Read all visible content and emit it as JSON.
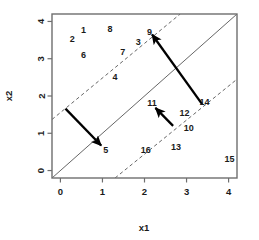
{
  "chart_data": {
    "type": "scatter",
    "title": "",
    "xlabel": "x1",
    "ylabel": "x2",
    "xlim": [
      -0.2,
      4.2
    ],
    "ylim": [
      -0.2,
      4.2
    ],
    "grid": false,
    "legend": null,
    "xticks": [
      "0",
      "1",
      "2",
      "3",
      "4"
    ],
    "xtickvalues": [
      0,
      1,
      2,
      3,
      4
    ],
    "yticks": [
      "0",
      "1",
      "2",
      "3",
      "4"
    ],
    "ytickvalues": [
      0,
      1,
      2,
      3,
      4
    ],
    "point_labels": [
      {
        "label": "1",
        "x": 0.55,
        "y": 3.78
      },
      {
        "label": "2",
        "x": 0.28,
        "y": 3.52
      },
      {
        "label": "3",
        "x": 1.85,
        "y": 3.45
      },
      {
        "label": "4",
        "x": 1.3,
        "y": 2.5
      },
      {
        "label": "5",
        "x": 1.08,
        "y": 0.55
      },
      {
        "label": "6",
        "x": 0.55,
        "y": 3.1
      },
      {
        "label": "7",
        "x": 1.48,
        "y": 3.18
      },
      {
        "label": "8",
        "x": 1.18,
        "y": 3.8
      },
      {
        "label": "9",
        "x": 2.12,
        "y": 3.72
      },
      {
        "label": "10",
        "x": 3.05,
        "y": 1.13
      },
      {
        "label": "11",
        "x": 2.18,
        "y": 1.82
      },
      {
        "label": "12",
        "x": 2.95,
        "y": 1.55
      },
      {
        "label": "13",
        "x": 2.75,
        "y": 0.62
      },
      {
        "label": "14",
        "x": 3.43,
        "y": 1.85
      },
      {
        "label": "15",
        "x": 4.02,
        "y": 0.3
      },
      {
        "label": "16",
        "x": 2.03,
        "y": 0.55
      }
    ],
    "lines": [
      {
        "name": "solid-diagonal",
        "style": "solid",
        "x1": -0.2,
        "y1": -0.2,
        "x2": 4.2,
        "y2": 4.2
      },
      {
        "name": "upper-dashed-diagonal",
        "style": "dashed",
        "x1": -0.2,
        "y1": 1.37,
        "x2": 2.85,
        "y2": 4.2
      },
      {
        "name": "lower-dashed-diagonal",
        "style": "dashed",
        "x1": 1.3,
        "y1": -0.2,
        "x2": 4.2,
        "y2": 2.45
      }
    ],
    "arrows": [
      {
        "name": "arrow-to-5",
        "x1": 0.12,
        "y1": 1.66,
        "x2": 0.97,
        "y2": 0.67
      },
      {
        "name": "arrow-to-9",
        "x1": 3.37,
        "y1": 1.78,
        "x2": 2.18,
        "y2": 3.65
      },
      {
        "name": "arrow-to-11",
        "x1": 2.68,
        "y1": 1.2,
        "x2": 2.26,
        "y2": 1.68
      }
    ]
  },
  "style": {
    "axis_color": "#666666",
    "line_color": "#555555",
    "arrow_color": "#000000",
    "text_color": "#1a1a1a",
    "background": "#ffffff"
  }
}
